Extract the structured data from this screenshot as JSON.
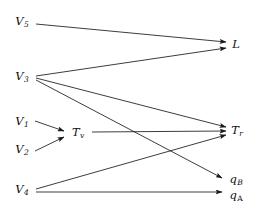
{
  "figure": {
    "type": "directed-graph-diagram",
    "width": 257,
    "height": 211,
    "background_color": "#ffffff",
    "edge_color": "#1a1a1a",
    "label_color": "#101010"
  },
  "nodes": [
    {
      "id": "V5",
      "base": "V",
      "sub": "5",
      "sub_style": "italic",
      "x": 22,
      "y": 22
    },
    {
      "id": "V3",
      "base": "V",
      "sub": "3",
      "sub_style": "italic",
      "x": 22,
      "y": 77
    },
    {
      "id": "V1",
      "base": "V",
      "sub": "1",
      "sub_style": "italic",
      "x": 22,
      "y": 122
    },
    {
      "id": "V2",
      "base": "V",
      "sub": "2",
      "sub_style": "italic",
      "x": 22,
      "y": 150
    },
    {
      "id": "V4",
      "base": "V",
      "sub": "4",
      "sub_style": "italic",
      "x": 22,
      "y": 190
    },
    {
      "id": "Tv",
      "base": "T",
      "sub": "v",
      "sub_style": "italic",
      "x": 78,
      "y": 133
    },
    {
      "id": "L",
      "base": "L",
      "sub": "",
      "sub_style": "italic",
      "x": 236,
      "y": 45
    },
    {
      "id": "Tr",
      "base": "T",
      "sub": "r",
      "sub_style": "italic",
      "x": 237,
      "y": 131
    },
    {
      "id": "qB",
      "base": "q",
      "sub": "B",
      "sub_style": "italic",
      "x": 236,
      "y": 180
    },
    {
      "id": "qA",
      "base": "q",
      "sub": "A",
      "sub_style": "upright",
      "x": 236,
      "y": 196
    }
  ],
  "edges": [
    {
      "id": "V5-L",
      "from": "V5",
      "to": "L",
      "x1": 36,
      "y1": 24,
      "x2": 226,
      "y2": 42,
      "arrow": true
    },
    {
      "id": "V3-L",
      "from": "V3",
      "to": "L",
      "x1": 36,
      "y1": 76,
      "x2": 226,
      "y2": 48,
      "arrow": true
    },
    {
      "id": "V3-Tr",
      "from": "V3",
      "to": "Tr",
      "x1": 36,
      "y1": 78,
      "x2": 226,
      "y2": 127,
      "arrow": true
    },
    {
      "id": "V3-qB",
      "from": "V3",
      "to": "qB",
      "x1": 36,
      "y1": 80,
      "x2": 222,
      "y2": 178,
      "arrow": true
    },
    {
      "id": "V1-Tv",
      "from": "V1",
      "to": "Tv",
      "x1": 35,
      "y1": 121,
      "x2": 64,
      "y2": 131,
      "arrow": true
    },
    {
      "id": "V2-Tv",
      "from": "V2",
      "to": "Tv",
      "x1": 35,
      "y1": 151,
      "x2": 64,
      "y2": 137,
      "arrow": true
    },
    {
      "id": "Tv-Tr",
      "from": "Tv",
      "to": "Tr",
      "x1": 92,
      "y1": 132,
      "x2": 226,
      "y2": 131,
      "arrow": true
    },
    {
      "id": "V4-Tr",
      "from": "V4",
      "to": "Tr",
      "x1": 36,
      "y1": 189,
      "x2": 226,
      "y2": 135,
      "arrow": true
    },
    {
      "id": "V4-qA",
      "from": "V4",
      "to": "qA",
      "x1": 36,
      "y1": 192,
      "x2": 222,
      "y2": 192,
      "arrow": true
    }
  ]
}
